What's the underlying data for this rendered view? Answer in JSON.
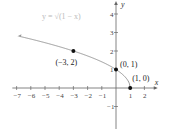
{
  "chart_data": {
    "type": "line",
    "title": "",
    "function_label": "y = √(1 − x)",
    "xlabel": "x",
    "ylabel": "y",
    "xlim": [
      -7.3,
      2.8
    ],
    "ylim": [
      -1.6,
      4.5
    ],
    "x_ticks": [
      "-7",
      "-6",
      "-5",
      "-4",
      "-3",
      "-2",
      "-1",
      "1",
      "2"
    ],
    "y_ticks": [
      "-1",
      "1",
      "2",
      "3",
      "4"
    ],
    "grid": false,
    "series": [
      {
        "name": "y = √(1 − x)",
        "x": [
          -6.8,
          -6,
          -5,
          -4,
          -3,
          -2,
          -1,
          0,
          0.5,
          0.9,
          1
        ],
        "y": [
          2.77,
          2.65,
          2.45,
          2.24,
          2.0,
          1.73,
          1.41,
          1.0,
          0.71,
          0.32,
          0
        ],
        "color": "#999999",
        "arrow_left": true
      }
    ],
    "points": [
      {
        "label": "(−3, 2)",
        "x": -3,
        "y": 2
      },
      {
        "label": "(0, 1)",
        "x": 0,
        "y": 1
      },
      {
        "label": "(1, 0)",
        "x": 1,
        "y": 0
      }
    ]
  }
}
